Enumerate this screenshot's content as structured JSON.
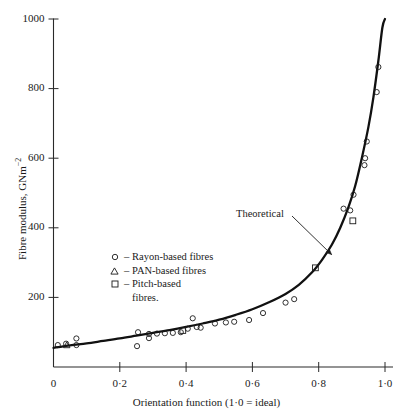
{
  "chart_data": {
    "type": "scatter",
    "title": "",
    "xlabel": "Orientation function (1·0 = ideal)",
    "ylabel": "Fibre modulus, GNm⁻²",
    "xlim": [
      0,
      1.05
    ],
    "ylim": [
      0,
      1040
    ],
    "xticks": [
      0,
      0.2,
      0.4,
      0.6,
      0.8,
      1.0
    ],
    "xticklabels": [
      "0",
      "0·2",
      "0·4",
      "0·6",
      "0·8",
      "1·0"
    ],
    "yticks": [
      200,
      400,
      600,
      800,
      1000
    ],
    "yticklabels": [
      "200",
      "400",
      "600",
      "800",
      "1000"
    ],
    "grid": false,
    "legend_position": "center-left",
    "annotations": [
      {
        "text": "Theoretical",
        "x": 0.62,
        "y": 330,
        "arrow_to_x": 0.845,
        "arrow_to_y": 300
      }
    ],
    "series": [
      {
        "name": "Rayon-based fibres",
        "marker": "circle",
        "points": [
          [
            0.013,
            63
          ],
          [
            0.038,
            67
          ],
          [
            0.069,
            82
          ],
          [
            0.069,
            63
          ],
          [
            0.252,
            60
          ],
          [
            0.255,
            100
          ],
          [
            0.288,
            95
          ],
          [
            0.288,
            83
          ],
          [
            0.312,
            96
          ],
          [
            0.336,
            97
          ],
          [
            0.36,
            98
          ],
          [
            0.384,
            100
          ],
          [
            0.405,
            110
          ],
          [
            0.42,
            140
          ],
          [
            0.432,
            115
          ],
          [
            0.444,
            113
          ],
          [
            0.487,
            125
          ],
          [
            0.52,
            128
          ],
          [
            0.545,
            130
          ],
          [
            0.59,
            135
          ],
          [
            0.632,
            155
          ],
          [
            0.7,
            185
          ],
          [
            0.726,
            195
          ],
          [
            0.875,
            455
          ],
          [
            0.905,
            495
          ],
          [
            0.895,
            450
          ],
          [
            0.938,
            580
          ],
          [
            0.94,
            600
          ],
          [
            0.945,
            648
          ],
          [
            0.975,
            790
          ],
          [
            0.98,
            862
          ]
        ]
      },
      {
        "name": "PAN-based fibres",
        "marker": "triangle",
        "points": [
          [
            0.04,
            63
          ]
        ]
      },
      {
        "name": "Pitch-based fibres.",
        "marker": "square",
        "points": [
          [
            0.39,
            105
          ],
          [
            0.79,
            285
          ],
          [
            0.903,
            420
          ]
        ]
      }
    ],
    "theoretical_curve": {
      "name": "Theoretical",
      "points": [
        [
          0.0,
          55
        ],
        [
          0.05,
          62
        ],
        [
          0.1,
          68
        ],
        [
          0.15,
          75
        ],
        [
          0.2,
          82
        ],
        [
          0.25,
          90
        ],
        [
          0.3,
          98
        ],
        [
          0.35,
          106
        ],
        [
          0.4,
          115
        ],
        [
          0.45,
          125
        ],
        [
          0.5,
          136
        ],
        [
          0.55,
          150
        ],
        [
          0.6,
          166
        ],
        [
          0.65,
          186
        ],
        [
          0.7,
          210
        ],
        [
          0.74,
          236
        ],
        [
          0.78,
          272
        ],
        [
          0.81,
          308
        ],
        [
          0.84,
          352
        ],
        [
          0.865,
          400
        ],
        [
          0.89,
          460
        ],
        [
          0.91,
          520
        ],
        [
          0.93,
          600
        ],
        [
          0.95,
          690
        ],
        [
          0.965,
          775
        ],
        [
          0.98,
          880
        ],
        [
          0.992,
          975
        ],
        [
          1.0,
          1000
        ]
      ]
    }
  },
  "legend": {
    "items": [
      {
        "symbol": "circle",
        "dash": "–",
        "label": "Rayon-based fibres"
      },
      {
        "symbol": "triangle",
        "dash": "–",
        "label": "PAN-based fibres"
      },
      {
        "symbol": "square",
        "dash": "–",
        "label": "Pitch-based",
        "label_cont": "fibres."
      }
    ]
  },
  "axes": {
    "y_title_main": "Fibre modulus, GNm",
    "y_title_sup": "−2",
    "x_title": "Orientation function (1·0 = ideal)"
  },
  "colors": {
    "ink": "#1a1a1a",
    "curve": "#111111",
    "background": "#ffffff"
  }
}
